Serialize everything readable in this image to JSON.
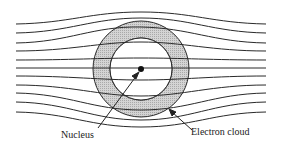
{
  "diagram": {
    "type": "atom-in-field",
    "labels": {
      "nucleus": "Nucleus",
      "electron_cloud": "Electron cloud"
    },
    "field_lines_count": 11,
    "colors": {
      "line": "#2a2a2a",
      "cloud_fill": "#c8c8c8",
      "nucleus": "#111111"
    }
  }
}
